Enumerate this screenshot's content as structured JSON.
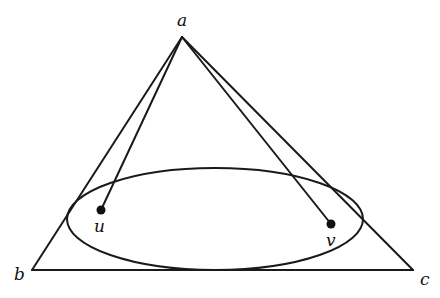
{
  "diagram": {
    "stroke_color": "#1a1a1a",
    "background": "#ffffff",
    "vertices": {
      "a": {
        "label": "a",
        "x": 182,
        "y": 37
      },
      "b": {
        "label": "b",
        "x": 32,
        "y": 270
      },
      "c": {
        "label": "c",
        "x": 413,
        "y": 270
      }
    },
    "ellipse": {
      "cx": 215,
      "cy": 219,
      "rx": 148,
      "ry": 51
    },
    "points": {
      "u": {
        "label": "u",
        "x": 101,
        "y": 210
      },
      "v": {
        "label": "v",
        "x": 331,
        "y": 224
      }
    },
    "segments": [
      {
        "from": "a",
        "to": "b"
      },
      {
        "from": "a",
        "to": "c"
      },
      {
        "from": "b",
        "to": "c"
      },
      {
        "from": "a",
        "to": "u"
      },
      {
        "from": "a",
        "to": "v"
      }
    ]
  }
}
